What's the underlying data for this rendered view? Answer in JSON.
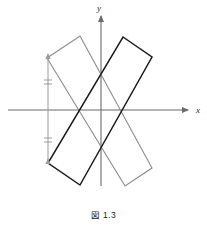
{
  "figure": {
    "caption": "図 1.3",
    "background_color": "#ffffff",
    "width": 207,
    "height": 228
  },
  "axes": {
    "x_label": "x",
    "y_label": "y",
    "axis_color": "#6b6b6b",
    "x_axis": {
      "x1": 8,
      "y1": 110,
      "x2": 188,
      "y2": 110
    },
    "y_axis": {
      "x1": 101,
      "y1": 186,
      "x2": 101,
      "y2": 16
    },
    "x_label_pos": {
      "x": 196,
      "y": 113
    },
    "y_label_pos": {
      "x": 99,
      "y": 11
    },
    "origin": {
      "x": 101,
      "y": 110
    }
  },
  "chart_data": {
    "type": "diagram",
    "title": "図 1.3",
    "xlabel": "x",
    "ylabel": "y",
    "shapes": [
      {
        "name": "rectangle-gray",
        "color": "#8a8a8a",
        "stroke_width": 1.1,
        "points": [
          {
            "x": 47,
            "y": 58
          },
          {
            "x": 80,
            "y": 36
          },
          {
            "x": 152,
            "y": 168
          },
          {
            "x": 125,
            "y": 186
          }
        ]
      },
      {
        "name": "rectangle-black",
        "color": "#1a1a1a",
        "stroke_width": 1.5,
        "points": [
          {
            "x": 123,
            "y": 37
          },
          {
            "x": 152,
            "y": 57
          },
          {
            "x": 80,
            "y": 185
          },
          {
            "x": 48,
            "y": 163
          }
        ]
      }
    ],
    "dimension_line": {
      "name": "vertical-dimension",
      "color": "#9a9a9a",
      "x": 48,
      "y_top": 58,
      "y_bottom": 163,
      "tick_marks": [
        {
          "y": 80
        },
        {
          "y": 84
        },
        {
          "y": 138
        },
        {
          "y": 142
        }
      ],
      "tick_half_width": 4
    },
    "grid": false,
    "legend": null
  }
}
